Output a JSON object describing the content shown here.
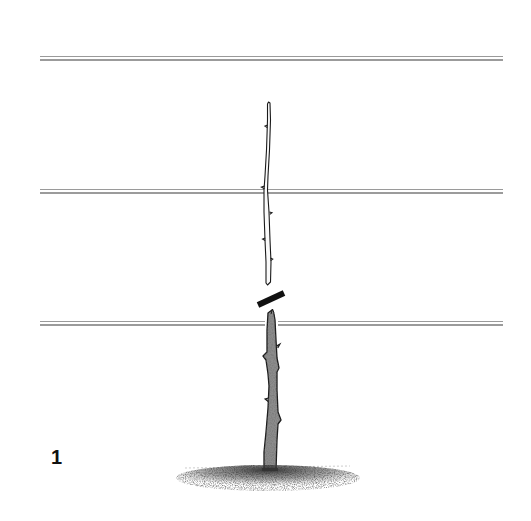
{
  "figure": {
    "label": "1",
    "colors": {
      "background": "#ffffff",
      "wire": "#8a8a8a",
      "trunk_fill": "#8c8c8c",
      "outline": "#1a1a1a",
      "cut_mark": "#111111",
      "soil": "#444444"
    },
    "wires": [
      {
        "name": "top-wire",
        "y": 57,
        "x1": 40,
        "x2": 503
      },
      {
        "name": "middle-wire",
        "y": 190,
        "x1": 40,
        "x2": 503
      },
      {
        "name": "bottom-wire",
        "y": 322,
        "x1": 40,
        "x2": 503
      }
    ],
    "cut_mark": {
      "x1": 258,
      "y1": 305,
      "x2": 284,
      "y2": 293
    }
  }
}
